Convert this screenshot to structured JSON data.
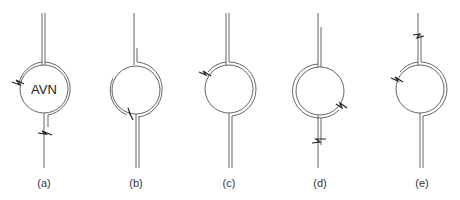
{
  "figure": {
    "panels": [
      {
        "id": "a",
        "label": "(a)",
        "circle_text": "AVN",
        "cx": 44,
        "cy": 89
      },
      {
        "id": "b",
        "label": "(b)",
        "circle_text": "",
        "cx": 136,
        "cy": 90
      },
      {
        "id": "c",
        "label": "(c)",
        "circle_text": "",
        "cx": 229,
        "cy": 89
      },
      {
        "id": "d",
        "label": "(d)",
        "circle_text": "",
        "cx": 320,
        "cy": 91
      },
      {
        "id": "e",
        "label": "(e)",
        "circle_text": "",
        "cx": 420,
        "cy": 89
      }
    ],
    "colors": {
      "line": "#555555",
      "break_mark": "#222222",
      "text": "#333333",
      "background": "#ffffff"
    }
  }
}
